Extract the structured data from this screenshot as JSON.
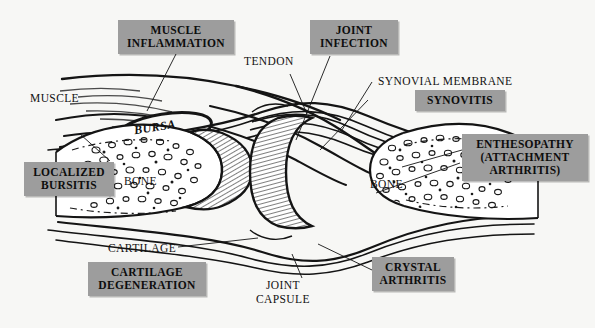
{
  "figure": {
    "type": "anatomical-diagram",
    "background_color": "#f7f7f5",
    "line_color": "#111111",
    "highlight_box_color": "#9d9d9d"
  },
  "anatomy_labels": [
    {
      "id": "muscle",
      "text": "MUSCLE"
    },
    {
      "id": "tendon",
      "text": "TENDON"
    },
    {
      "id": "synovial_membrane",
      "text": "SYNOVIAL MEMBRANE"
    },
    {
      "id": "bursa",
      "text": "BURSA"
    },
    {
      "id": "bone_left",
      "text": "BONE"
    },
    {
      "id": "bone_right",
      "text": "BONE"
    },
    {
      "id": "cartilage",
      "text": "CARTILAGE"
    },
    {
      "id": "joint_capsule",
      "text": "JOINT\nCAPSULE"
    }
  ],
  "pathology_labels": [
    {
      "id": "muscle_inflammation",
      "text": "MUSCLE\nINFLAMMATION"
    },
    {
      "id": "joint_infection",
      "text": "JOINT\nINFECTION"
    },
    {
      "id": "synovitis",
      "text": "SYNOVITIS"
    },
    {
      "id": "enthesopathy",
      "text": "ENTHESOPATHY\n(ATTACHMENT\nARTHRITIS)"
    },
    {
      "id": "localized_bursitis",
      "text": "LOCALIZED\nBURSITIS"
    },
    {
      "id": "cartilage_degeneration",
      "text": "CARTILAGE\nDEGENERATION"
    },
    {
      "id": "crystal_arthritis",
      "text": "CRYSTAL\nARTHRITIS"
    }
  ]
}
